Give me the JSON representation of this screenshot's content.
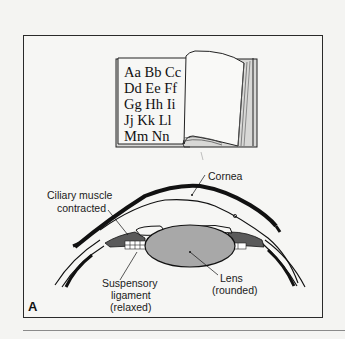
{
  "figure": {
    "panel_letter": "A",
    "book": {
      "lines": [
        "Aa Bb Cc",
        "Dd Ee Ff",
        "Gg Hh Ii",
        "Jj Kk Ll",
        "Mm Nn"
      ]
    },
    "labels": {
      "cornea": "Cornea",
      "ciliary_line1": "Ciliary muscle",
      "ciliary_line2": "contracted",
      "suspensory_line1": "Suspensory",
      "suspensory_line2": "ligament",
      "suspensory_line3": "(relaxed)",
      "lens_line1": "Lens",
      "lens_line2": "(rounded)"
    },
    "colors": {
      "lens_fill": "#a8a8a8",
      "ciliary_fill": "#5a5a5a",
      "outline": "#111111",
      "background": "#f6f6f4"
    }
  }
}
